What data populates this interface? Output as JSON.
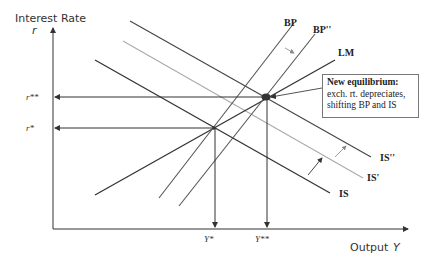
{
  "axes": {
    "y_title": "Interest Rate",
    "y_symbol": "r",
    "x_title": "Output",
    "x_symbol": "Y"
  },
  "ticks": {
    "r_star_star": "r**",
    "r_star": "r*",
    "y_star": "Y*",
    "y_star_star": "Y**"
  },
  "curves": {
    "bp": "BP",
    "bp2": "BP''",
    "lm": "LM",
    "is": "IS",
    "is1": "IS'",
    "is2": "IS''"
  },
  "annotation": {
    "bold": "New equilibrium:",
    "rest": " exch. rt. depreciates, shifting BP and IS"
  },
  "colors": {
    "dark_line": "#333333",
    "gray_line": "#a8a8a8"
  }
}
